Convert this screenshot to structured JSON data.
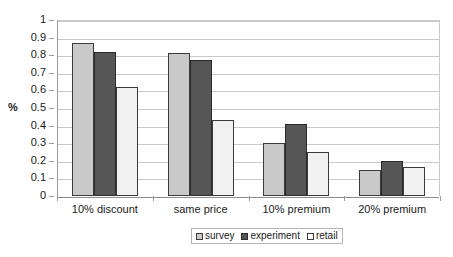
{
  "chart_data": {
    "type": "bar",
    "title": "",
    "xlabel": "",
    "ylabel": "%",
    "ylim": [
      0,
      1
    ],
    "ytick_step": 0.1,
    "ytick_labels": [
      "1",
      "0.9",
      "0.8",
      "0.7",
      "0.6",
      "0.5",
      "0.4",
      "0.3",
      "0.2",
      "0.1",
      "0"
    ],
    "ytick_values": [
      1,
      0.9,
      0.8,
      0.7,
      0.6,
      0.5,
      0.4,
      0.3,
      0.2,
      0.1,
      0
    ],
    "grid": "horizontal",
    "legend_position": "bottom-center",
    "categories": [
      "10% discount",
      "same price",
      "10% premium",
      "20% premium"
    ],
    "series": [
      {
        "name": "survey",
        "color": "#c9c9c9",
        "values": [
          0.87,
          0.81,
          0.3,
          0.15
        ]
      },
      {
        "name": "experiment",
        "color": "#565656",
        "values": [
          0.82,
          0.77,
          0.41,
          0.2
        ]
      },
      {
        "name": "retail",
        "color": "#f1f1f1",
        "values": [
          0.62,
          0.43,
          0.25,
          0.165
        ]
      }
    ]
  },
  "axis": {
    "y_title": "%"
  },
  "legend": {
    "entries": [
      "survey",
      "experiment",
      "retail"
    ]
  }
}
